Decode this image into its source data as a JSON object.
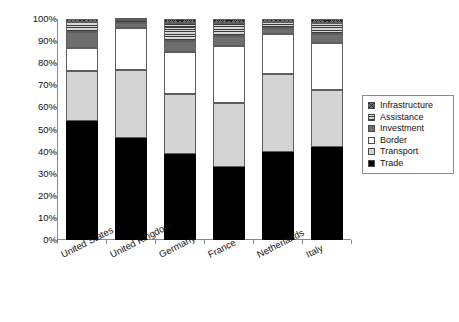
{
  "chart_data": {
    "type": "bar",
    "stacked": true,
    "title": "",
    "xlabel": "",
    "ylabel": "",
    "ylim": [
      0,
      100
    ],
    "y_unit": "%",
    "grid": false,
    "legend_position": "right",
    "categories": [
      "United States",
      "United Kingdom",
      "Germany",
      "France",
      "Netherlands",
      "Italy"
    ],
    "y_ticks": [
      "0%",
      "10%",
      "20%",
      "30%",
      "40%",
      "50%",
      "60%",
      "70%",
      "80%",
      "90%",
      "100%"
    ],
    "series": [
      {
        "name": "Trade",
        "swatch": "solid-black",
        "color": "#000000",
        "values": [
          54,
          46,
          39,
          33,
          40,
          42
        ]
      },
      {
        "name": "Transport",
        "swatch": "light-gray",
        "color": "#d4d4d4",
        "values": [
          22.5,
          31,
          27,
          29,
          35,
          26
        ]
      },
      {
        "name": "Border",
        "swatch": "white",
        "color": "#ffffff",
        "values": [
          10.5,
          19,
          19,
          26,
          18,
          21
        ]
      },
      {
        "name": "Investment",
        "swatch": "dark-gray",
        "color": "#6e6e6e",
        "values": [
          7,
          2,
          5,
          4.5,
          3,
          4
        ]
      },
      {
        "name": "Assistance",
        "swatch": "horiz-lines",
        "color": "#9c9c9c",
        "values": [
          4.5,
          1.5,
          8,
          5.5,
          2.5,
          5
        ]
      },
      {
        "name": "Infrastructure",
        "swatch": "checker",
        "color": "#707070",
        "values": [
          1.5,
          0.5,
          2,
          2,
          1.5,
          2
        ]
      }
    ]
  },
  "legend": {
    "items": [
      {
        "label": "Infrastructure"
      },
      {
        "label": "Assistance"
      },
      {
        "label": "Investment"
      },
      {
        "label": "Border"
      },
      {
        "label": "Transport"
      },
      {
        "label": "Trade"
      }
    ]
  }
}
